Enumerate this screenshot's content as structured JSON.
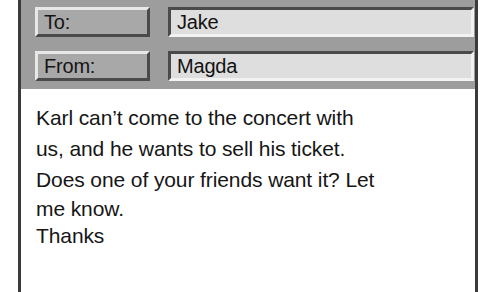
{
  "window": {
    "name": "email-message-card"
  },
  "header": {
    "fields": [
      {
        "label": "To:",
        "value": "Jake"
      },
      {
        "label": "From:",
        "value": "Magda"
      }
    ]
  },
  "body": {
    "lines": [
      "Karl can’t come to the concert with",
      "us, and he wants to sell his ticket.",
      "Does one of your friends want it? Let",
      "me know.",
      "Thanks"
    ]
  },
  "colors": {
    "header_background": "#9d9d9d",
    "body_background": "#ffffff",
    "frame_border": "#3b3b3b",
    "label_fill": "#a8a8a8",
    "value_fill": "#dedede",
    "text": "#161616"
  }
}
